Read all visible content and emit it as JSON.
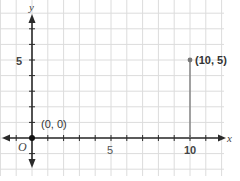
{
  "chart_data": {
    "type": "line",
    "title": "",
    "xlabel": "x",
    "ylabel": "y",
    "origin_label": "O",
    "x_ticks": [
      5,
      10
    ],
    "y_ticks": [
      5
    ],
    "x_tick_labels": [
      "5",
      "10"
    ],
    "y_tick_labels": [
      "5"
    ],
    "xlim": [
      -2,
      12
    ],
    "ylim": [
      -2,
      8
    ],
    "grid": true,
    "points": [
      {
        "x": 0,
        "y": 0,
        "label": "(0, 0)"
      },
      {
        "x": 10,
        "y": 5,
        "label": "(10, 5)"
      }
    ],
    "segments": [
      {
        "from": [
          10,
          0
        ],
        "to": [
          10,
          5
        ]
      }
    ],
    "colors": {
      "grid": "#dcdcdc",
      "axis": "#2a2a2a",
      "segment": "#777777",
      "point": "#777777",
      "origin_point": "#111111"
    }
  }
}
